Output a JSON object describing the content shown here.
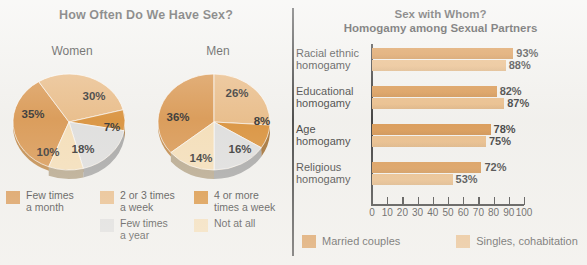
{
  "colors": {
    "dark_orange": "#d68a3a",
    "mid_orange": "#e0a05c",
    "light_orange": "#e8b478",
    "deep_orange": "#d6821e",
    "pale_cream": "#f6dcb0",
    "grey": "#dcdcdc",
    "grey_side": "#8d8d8d",
    "background": "#f2f1ee",
    "text": "#1b1b1b",
    "axis": "#1d1d1d"
  },
  "left": {
    "title": "How Often Do We Have Sex?",
    "pies": [
      {
        "label": "Women"
      },
      {
        "label": "Men"
      }
    ],
    "legend": [
      {
        "key": "few_times_month",
        "label": "Few times\na month",
        "color": "#d68a3a"
      },
      {
        "key": "two_three_week",
        "label": "2 or 3 times\na week",
        "color": "#e8b478"
      },
      {
        "key": "four_more_week",
        "label": "4 or more\ntimes a week",
        "color": "#d6821e"
      },
      {
        "key": "few_times_year",
        "label": "Few times\na year",
        "color": "#dcdcdc"
      },
      {
        "key": "not_at_all",
        "label": "Not at all",
        "color": "#f6dcb0"
      }
    ]
  },
  "right": {
    "title_line1": "Sex with Whom?",
    "title_line2": "Homogamy among Sexual Partners",
    "legend": [
      {
        "key": "married",
        "label": "Married couples",
        "color": "#d68a3a"
      },
      {
        "key": "singles",
        "label": "Singles, cohabitation",
        "color": "#e8b478"
      }
    ]
  },
  "chart_data": [
    {
      "type": "pie",
      "title": "Women",
      "chart_group_title": "How Often Do We Have Sex?",
      "labels": [
        "Few times a month",
        "2 or 3 times a week",
        "4 or more times a week",
        "Few times a year",
        "Not at all"
      ],
      "values": [
        35,
        30,
        7,
        18,
        10
      ],
      "value_labels": [
        "35%",
        "30%",
        "7%",
        "18%",
        "10%"
      ],
      "colors": [
        "#d68a3a",
        "#e8b478",
        "#d6821e",
        "#dcdcdc",
        "#f6dcb0"
      ],
      "legend_position": "bottom",
      "three_d": true
    },
    {
      "type": "pie",
      "title": "Men",
      "chart_group_title": "How Often Do We Have Sex?",
      "labels": [
        "Few times a month",
        "2 or 3 times a week",
        "4 or more times a week",
        "Few times a year",
        "Not at all"
      ],
      "values": [
        36,
        26,
        8,
        16,
        14
      ],
      "value_labels": [
        "36%",
        "26%",
        "8%",
        "16%",
        "14%"
      ],
      "colors": [
        "#d68a3a",
        "#e8b478",
        "#d6821e",
        "#dcdcdc",
        "#f6dcb0"
      ],
      "legend_position": "bottom",
      "three_d": true
    },
    {
      "type": "bar",
      "orientation": "horizontal",
      "title": "Sex with Whom?",
      "subtitle": "Homogamy among Sexual Partners",
      "categories": [
        "Racial ethnic\nhomogamy",
        "Educational\nhomogamy",
        "Age\nhomogamy",
        "Religious\nhomogamy"
      ],
      "series": [
        {
          "name": "Married couples",
          "color": "#d68a3a",
          "values": [
            93,
            82,
            78,
            72
          ],
          "value_labels": [
            "93%",
            "82%",
            "78%",
            "72%"
          ]
        },
        {
          "name": "Singles, cohabitation",
          "color": "#e8b478",
          "values": [
            88,
            87,
            75,
            53
          ],
          "value_labels": [
            "88%",
            "87%",
            "75%",
            "53%"
          ]
        }
      ],
      "xlabel": "",
      "ylabel": "",
      "xlim": [
        0,
        100
      ],
      "xticks": [
        0,
        10,
        20,
        30,
        40,
        50,
        60,
        70,
        80,
        90,
        100
      ],
      "xtick_labels": [
        "0",
        "10",
        "20",
        "30",
        "40",
        "50",
        "60",
        "70",
        "80",
        "90",
        "100"
      ],
      "grid": false,
      "legend_position": "bottom"
    }
  ]
}
